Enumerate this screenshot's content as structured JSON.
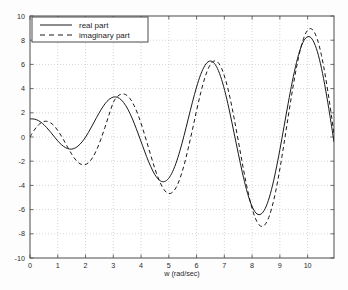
{
  "chart_data": {
    "type": "line",
    "title": "",
    "xlabel": "w (rad/sec)",
    "ylabel": "",
    "xlim": [
      0,
      10.95
    ],
    "ylim": [
      -10,
      10
    ],
    "grid": true,
    "grid_style": "dotted",
    "legend_position": "top-left",
    "xticks": [
      0,
      1,
      2,
      3,
      4,
      5,
      6,
      7,
      8,
      9,
      10
    ],
    "xtick_labels": [
      "0",
      "1",
      "2",
      "3",
      "4",
      "5",
      "6",
      "7",
      "8",
      "9",
      "10"
    ],
    "yticks": [
      -10,
      -8,
      -6,
      -4,
      -2,
      0,
      2,
      4,
      6,
      8,
      10
    ],
    "ytick_labels": [
      "-10",
      "-8",
      "-6",
      "-4",
      "-2",
      "0",
      "2",
      "4",
      "6",
      "8",
      "10"
    ],
    "x": [
      0,
      0.15,
      0.3,
      0.45,
      0.6,
      0.75,
      0.9,
      1.05,
      1.2,
      1.35,
      1.5,
      1.65,
      1.8,
      1.95,
      2.1,
      2.25,
      2.4,
      2.55,
      2.7,
      2.85,
      3,
      3.15,
      3.3,
      3.45,
      3.6,
      3.75,
      3.9,
      4.05,
      4.2,
      4.35,
      4.5,
      4.65,
      4.8,
      4.95,
      5.1,
      5.25,
      5.4,
      5.55,
      5.7,
      5.85,
      6,
      6.15,
      6.3,
      6.45,
      6.6,
      6.75,
      6.9,
      7.05,
      7.2,
      7.35,
      7.5,
      7.65,
      7.8,
      7.95,
      8.1,
      8.25,
      8.4,
      8.55,
      8.7,
      8.85,
      9,
      9.15,
      9.3,
      9.45,
      9.6,
      9.75,
      9.9,
      10.05,
      10.2,
      10.35,
      10.5,
      10.65,
      10.8,
      10.95
    ],
    "series": [
      {
        "name": "real part",
        "style": "solid",
        "color": "#1a1a1a",
        "values": [
          1.5,
          1.48,
          1.36,
          1.12,
          0.78,
          0.38,
          -0.05,
          -0.45,
          -0.76,
          -0.95,
          -1.0,
          -0.88,
          -0.6,
          -0.18,
          0.36,
          0.98,
          1.62,
          2.22,
          2.74,
          3.11,
          3.3,
          3.28,
          3.04,
          2.59,
          1.95,
          1.15,
          0.25,
          -0.69,
          -1.62,
          -2.45,
          -3.12,
          -3.55,
          -3.7,
          -3.53,
          -3.03,
          -2.22,
          -1.14,
          0.13,
          1.5,
          2.87,
          4.13,
          5.18,
          5.91,
          6.26,
          6.18,
          5.67,
          4.76,
          3.5,
          1.99,
          0.34,
          -1.34,
          -2.95,
          -4.36,
          -5.46,
          -6.17,
          -6.42,
          -6.19,
          -5.48,
          -4.33,
          -2.82,
          -1.05,
          0.86,
          2.79,
          4.6,
          6.16,
          7.36,
          8.09,
          8.3,
          7.95,
          7.06,
          5.67,
          3.88,
          1.8,
          -0.41
        ],
        "markers": [
          {
            "x": 0,
            "y": 1.5
          },
          {
            "x": 1.35,
            "y": -1.0
          },
          {
            "x": 2.6,
            "y": 3.3
          },
          {
            "x": 4.1,
            "y": -3.6
          },
          {
            "x": 5.6,
            "y": 6.3
          },
          {
            "x": 7.15,
            "y": -6.5
          },
          {
            "x": 8.7,
            "y": 9.4
          },
          {
            "x": 10.25,
            "y": -9.6
          }
        ]
      },
      {
        "name": "imaginary part",
        "style": "dashed",
        "color": "#1a1a1a",
        "values": [
          0.0,
          0.56,
          0.99,
          1.24,
          1.3,
          1.16,
          0.84,
          0.37,
          -0.2,
          -0.82,
          -1.41,
          -1.9,
          -2.21,
          -2.3,
          -2.14,
          -1.72,
          -1.06,
          -0.2,
          0.8,
          1.86,
          2.85,
          3.35,
          3.55,
          3.5,
          3.18,
          2.6,
          1.78,
          0.77,
          -0.36,
          -1.52,
          -2.63,
          -3.57,
          -4.26,
          -4.63,
          -4.62,
          -4.22,
          -3.44,
          -2.32,
          -0.93,
          0.6,
          2.18,
          3.66,
          4.91,
          5.8,
          6.25,
          6.21,
          5.68,
          4.68,
          3.28,
          1.58,
          -0.29,
          -2.19,
          -3.97,
          -5.48,
          -6.61,
          -7.26,
          -7.37,
          -6.92,
          -5.94,
          -4.48,
          -2.64,
          -0.54,
          1.67,
          3.82,
          5.76,
          7.33,
          8.42,
          8.93,
          8.81,
          8.07,
          6.73,
          4.89,
          2.69,
          0.26
        ],
        "markers": [
          {
            "x": 0,
            "y": 0.0
          },
          {
            "x": 0.6,
            "y": 1.3
          },
          {
            "x": 1.85,
            "y": -2.15
          },
          {
            "x": 3.3,
            "y": 3.55
          },
          {
            "x": 4.85,
            "y": -4.7
          },
          {
            "x": 6.35,
            "y": 6.45
          },
          {
            "x": 7.95,
            "y": -7.8
          },
          {
            "x": 9.5,
            "y": 9.7
          }
        ]
      }
    ]
  },
  "legend": {
    "items": [
      {
        "label": "real part",
        "style": "solid"
      },
      {
        "label": "imaginary part",
        "style": "dashed"
      }
    ]
  }
}
